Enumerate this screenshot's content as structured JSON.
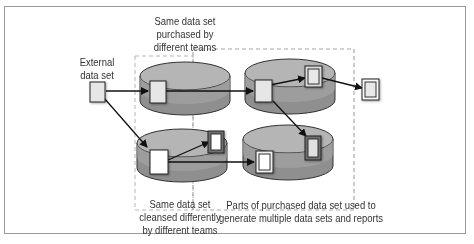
{
  "diagram": {
    "labels": {
      "external": [
        "External",
        "data set"
      ],
      "purchased": [
        "Same data set",
        "purchased by",
        "different teams"
      ],
      "cleansed": [
        "Same data set",
        "cleansed differently",
        "by different teams"
      ],
      "parts": [
        "Parts of purchased data set used to",
        "generate multiple data sets and reports"
      ]
    },
    "nodes": [
      {
        "id": "external-data-set",
        "type": "document"
      },
      {
        "id": "team-a-purchased",
        "type": "database"
      },
      {
        "id": "team-b-cleansed",
        "type": "database"
      },
      {
        "id": "team-a-derived",
        "type": "database"
      },
      {
        "id": "team-b-derived",
        "type": "database"
      },
      {
        "id": "report-output",
        "type": "report"
      }
    ],
    "colors": {
      "cylinder_top": "#b3b3b3",
      "cylinder_body": "#8f8f8f",
      "doc_fill": "#e4e4e4",
      "doc_white": "#ffffff",
      "report_frame": "#555555",
      "dashed": "#a8a8a8",
      "arrow": "#111111"
    }
  }
}
